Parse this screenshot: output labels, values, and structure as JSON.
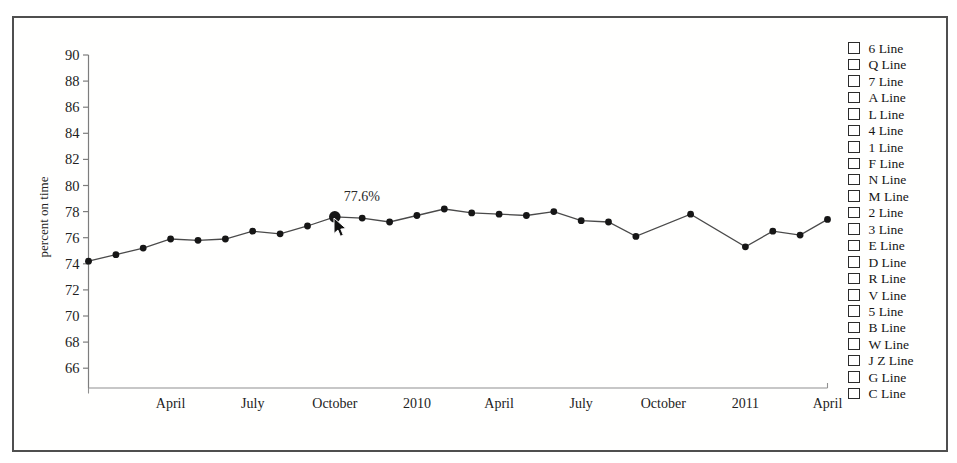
{
  "figure": {
    "background": "#ffffff",
    "border_color": "#4f4f4f"
  },
  "chart_data": {
    "type": "line",
    "title": "",
    "xlabel": "",
    "ylabel": "percent on time",
    "ylim": [
      64.5,
      90
    ],
    "yticks": [
      66,
      68,
      70,
      72,
      74,
      76,
      78,
      80,
      82,
      84,
      86,
      88,
      90
    ],
    "grid": false,
    "legend_position": "right",
    "n_slots": 28,
    "xticks": [
      {
        "slot": 3,
        "label": "April"
      },
      {
        "slot": 6,
        "label": "July"
      },
      {
        "slot": 9,
        "label": "October"
      },
      {
        "slot": 12,
        "label": "2010"
      },
      {
        "slot": 15,
        "label": "April"
      },
      {
        "slot": 18,
        "label": "July"
      },
      {
        "slot": 21,
        "label": "October"
      },
      {
        "slot": 24,
        "label": "2011"
      },
      {
        "slot": 27,
        "label": "April"
      }
    ],
    "series": [
      {
        "name": "percent on time",
        "points": [
          {
            "slot": 0,
            "value": 74.2
          },
          {
            "slot": 1,
            "value": 74.7
          },
          {
            "slot": 2,
            "value": 75.2
          },
          {
            "slot": 3,
            "value": 75.9
          },
          {
            "slot": 4,
            "value": 75.8
          },
          {
            "slot": 5,
            "value": 75.9
          },
          {
            "slot": 6,
            "value": 76.5
          },
          {
            "slot": 7,
            "value": 76.3
          },
          {
            "slot": 8,
            "value": 76.9
          },
          {
            "slot": 9,
            "value": 77.6,
            "highlight": true
          },
          {
            "slot": 10,
            "value": 77.5
          },
          {
            "slot": 11,
            "value": 77.2
          },
          {
            "slot": 12,
            "value": 77.7
          },
          {
            "slot": 13,
            "value": 78.2
          },
          {
            "slot": 14,
            "value": 77.9
          },
          {
            "slot": 15,
            "value": 77.8
          },
          {
            "slot": 16,
            "value": 77.7
          },
          {
            "slot": 17,
            "value": 78.0
          },
          {
            "slot": 18,
            "value": 77.3
          },
          {
            "slot": 19,
            "value": 77.2
          },
          {
            "slot": 20,
            "value": 76.1
          },
          {
            "slot": 22,
            "value": 77.8
          },
          {
            "slot": 24,
            "value": 75.3
          },
          {
            "slot": 25,
            "value": 76.5
          },
          {
            "slot": 26,
            "value": 76.2
          },
          {
            "slot": 27,
            "value": 77.4
          }
        ]
      }
    ],
    "annotation": {
      "text": "77.6%",
      "slot": 9,
      "value": 77.6
    },
    "line_color": "#4a4a4a",
    "marker_color": "#161616",
    "axis_color": "#909090",
    "tick_text_color": "#222222"
  },
  "legend": {
    "items": [
      {
        "label": "6 Line",
        "checked": false
      },
      {
        "label": "Q Line",
        "checked": false
      },
      {
        "label": "7 Line",
        "checked": false
      },
      {
        "label": "A Line",
        "checked": false
      },
      {
        "label": "L Line",
        "checked": false
      },
      {
        "label": "4 Line",
        "checked": false
      },
      {
        "label": "1 Line",
        "checked": false
      },
      {
        "label": "F Line",
        "checked": false
      },
      {
        "label": "N Line",
        "checked": false
      },
      {
        "label": "M Line",
        "checked": false
      },
      {
        "label": "2 Line",
        "checked": false
      },
      {
        "label": "3 Line",
        "checked": false
      },
      {
        "label": "E Line",
        "checked": false
      },
      {
        "label": "D Line",
        "checked": false
      },
      {
        "label": "R Line",
        "checked": false
      },
      {
        "label": "V Line",
        "checked": false
      },
      {
        "label": "5 Line",
        "checked": false
      },
      {
        "label": "B Line",
        "checked": false
      },
      {
        "label": "W Line",
        "checked": false
      },
      {
        "label": "J Z Line",
        "checked": false
      },
      {
        "label": "G Line",
        "checked": false
      },
      {
        "label": "C Line",
        "checked": false
      }
    ]
  },
  "cursor": {
    "type": "arrow-pointer",
    "visible": true
  }
}
